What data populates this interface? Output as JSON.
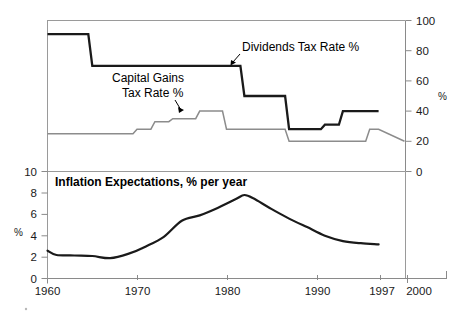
{
  "figure": {
    "width": 465,
    "height": 316,
    "background": "#ffffff"
  },
  "top_panel": {
    "right_axis": {
      "label": "%",
      "ticks": [
        "0",
        "20",
        "40",
        "60",
        "80",
        "100"
      ],
      "min": 0,
      "max": 100
    },
    "annotations": [
      {
        "id": "dividends",
        "line1": "Dividends Tax Rate %",
        "line2": ""
      },
      {
        "id": "capital_gains",
        "line1": "Capital Gains",
        "line2": "Tax Rate %"
      }
    ]
  },
  "bottom_panel": {
    "title": "Inflation Expectations, % per year",
    "left_axis": {
      "label": "%",
      "ticks": [
        "0",
        "2",
        "4",
        "6",
        "8",
        "10"
      ],
      "min": 0,
      "max": 10
    }
  },
  "x_axis": {
    "ticks": [
      "1960",
      "1970",
      "1980",
      "1990",
      "1997",
      "2000"
    ],
    "tick_values": [
      1960,
      1970,
      1980,
      1990,
      1997,
      2000
    ],
    "min": 1960,
    "max": 2000
  },
  "colors": {
    "dividends_line": "#1a1a1a",
    "capital_gains_line": "#8c8c8c",
    "inflation_line": "#1a1a1a",
    "frame": "#9a9a9a",
    "text": "#000000"
  },
  "chart_data": [
    {
      "type": "line",
      "id": "tax-rates-panel",
      "title": "",
      "xlabel": "",
      "ylabel": "%",
      "xlim": [
        1960,
        2000
      ],
      "ylim": [
        0,
        100
      ],
      "yticks": [
        0,
        20,
        40,
        60,
        80,
        100
      ],
      "xticks": [
        1960,
        1970,
        1980,
        1990,
        1997,
        2000
      ],
      "grid": false,
      "legend_position": "inline-annotation",
      "series": [
        {
          "name": "Dividends Tax Rate %",
          "style": "step",
          "color": "#1a1a1a",
          "x": [
            1960,
            1963,
            1965,
            1981,
            1982,
            1986,
            1987,
            1988,
            1991,
            1993,
            1997
          ],
          "values": [
            91,
            91,
            70,
            70,
            50,
            50,
            28,
            28,
            31,
            40,
            40
          ]
        },
        {
          "name": "Capital Gains Tax Rate %",
          "style": "step",
          "color": "#8c8c8c",
          "x": [
            1960,
            1968,
            1970,
            1972,
            1974,
            1976,
            1977,
            1979,
            1980,
            1982,
            1987,
            1988,
            1996,
            1997
          ],
          "values": [
            25,
            25,
            28,
            33,
            35,
            35,
            40,
            40,
            28,
            28,
            20,
            20,
            28,
            28
          ]
        }
      ],
      "notes": "Capital gains line drops from 28 to 20 at the far right edge (1997)."
    },
    {
      "type": "line",
      "id": "inflation-expectations-panel",
      "title": "Inflation Expectations, % per year",
      "xlabel": "",
      "ylabel": "%",
      "xlim": [
        1960,
        2000
      ],
      "ylim": [
        0,
        10
      ],
      "yticks": [
        0,
        2,
        4,
        6,
        8,
        10
      ],
      "xticks": [
        1960,
        1970,
        1980,
        1990,
        1997,
        2000
      ],
      "grid": false,
      "legend_position": "none",
      "series": [
        {
          "name": "Inflation Expectations",
          "style": "smooth",
          "color": "#1a1a1a",
          "x": [
            1960,
            1961,
            1963,
            1965,
            1967,
            1969,
            1971,
            1973,
            1975,
            1977,
            1979,
            1981,
            1982,
            1983,
            1985,
            1987,
            1989,
            1991,
            1993,
            1995,
            1997
          ],
          "values": [
            2.6,
            2.2,
            2.15,
            2.1,
            1.9,
            2.3,
            3.0,
            3.9,
            5.4,
            5.9,
            6.6,
            7.4,
            7.8,
            7.5,
            6.5,
            5.6,
            4.8,
            4.0,
            3.5,
            3.3,
            3.2
          ]
        }
      ]
    }
  ]
}
